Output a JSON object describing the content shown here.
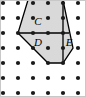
{
  "figure": {
    "canvas": {
      "width": 86,
      "height": 97,
      "background": "#ffffff"
    },
    "lattice": {
      "name": "dot-grid",
      "origin_x": 3,
      "origin_y": 3,
      "spacing_x": 15,
      "spacing_y": 15,
      "columns": 6,
      "rows": 7,
      "dot_radius": 2.1,
      "dot_color": "#1a1a1a"
    },
    "polygon": {
      "name": "shaded-pentagon",
      "fill": "#d9d9d9",
      "stroke": "#000000",
      "stroke_width": 1.3,
      "clipped_at_top": true,
      "vertices": [
        {
          "x": 28,
          "y": 0
        },
        {
          "x": 63,
          "y": 0
        },
        {
          "x": 73,
          "y": 48
        },
        {
          "x": 63,
          "y": 63
        },
        {
          "x": 48,
          "y": 63
        },
        {
          "x": 18,
          "y": 33
        }
      ]
    },
    "dividers": [
      {
        "name": "horizontal-divider",
        "x1": 18,
        "y1": 33,
        "x2": 69,
        "y2": 33,
        "stroke": "#000000",
        "stroke_width": 1.3
      },
      {
        "name": "vertical-divider",
        "x1": 63,
        "y1": 0,
        "x2": 63,
        "y2": 63,
        "stroke": "#000000",
        "stroke_width": 1.3
      }
    ],
    "labels": [
      {
        "id": "C",
        "text": "C",
        "x": 38,
        "y": 21
      },
      {
        "id": "D",
        "text": "D",
        "x": 38,
        "y": 42
      },
      {
        "id": "E",
        "text": "E",
        "x": 69,
        "y": 42
      }
    ],
    "frame": {
      "name": "image-border",
      "color": "#c8c8c8"
    }
  }
}
